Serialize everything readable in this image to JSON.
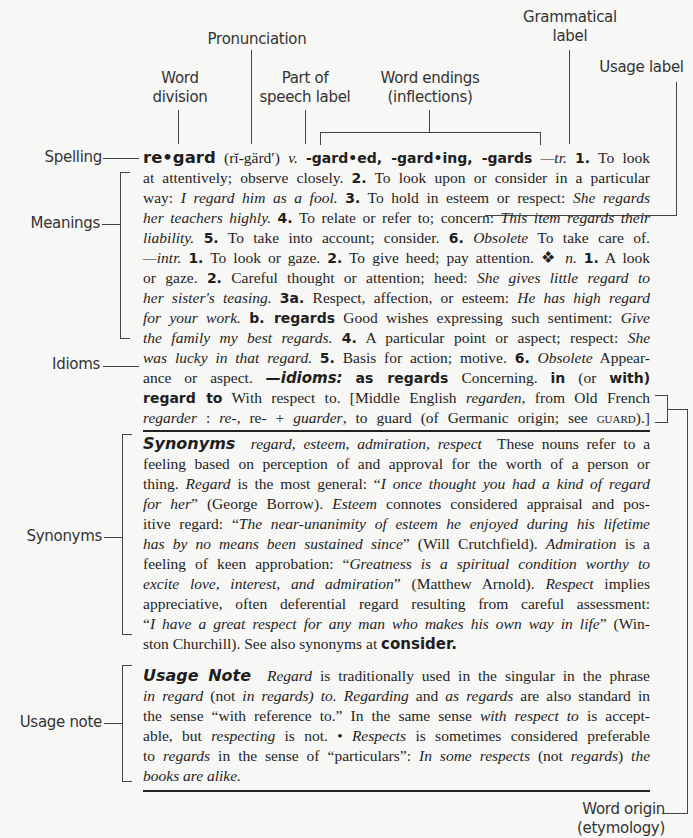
{
  "callouts": {
    "pronunciation": "Pronunciation",
    "grammatical_label": [
      "Grammatical",
      "label"
    ],
    "usage_label": "Usage label",
    "word_division": [
      "Word",
      "division"
    ],
    "part_of_speech": [
      "Part of",
      "speech label"
    ],
    "word_endings": [
      "Word endings",
      "(inflections)"
    ],
    "spelling": "Spelling",
    "meanings": "Meanings",
    "idioms": "Idioms",
    "synonyms": "Synonyms",
    "usage_note": "Usage note",
    "word_origin": [
      "Word origin",
      "(etymology)"
    ]
  },
  "entry": {
    "headword": "re•gard",
    "pronunciation": "(rĭ-gärd′)",
    "pos": "v.",
    "inflections": "-gard•ed, -gard•ing, -gards",
    "tr_label": "—tr.",
    "lines": [
      [
        "at attentively; observe closely. ",
        "2.",
        " To look upon or consider in a particular"
      ],
      [
        "way: ",
        "I regard him as a fool.",
        " ",
        "3.",
        " To hold in esteem or respect: ",
        "She regards"
      ],
      [
        "her teachers highly.",
        " ",
        "4.",
        " To relate or refer to; concern: ",
        "This item regards their"
      ],
      [
        "liability.",
        " ",
        "5.",
        " To take into account; consider. ",
        "6.",
        " ",
        "Obsolete",
        " To take care of."
      ],
      [
        "—intr.",
        " ",
        "1.",
        " To look or gaze. ",
        "2.",
        " To give heed; pay attention. ❖ ",
        "n.",
        " ",
        "1.",
        " A look"
      ],
      [
        "or gaze. ",
        "2.",
        " Careful thought or attention; heed: ",
        "She gives little regard to"
      ],
      [
        "her sister's teasing.",
        " ",
        "3a.",
        " Respect, affection, or esteem: ",
        "He has high regard"
      ],
      [
        "for your work.",
        " ",
        "b. regards",
        " Good wishes expressing such sentiment: ",
        "Give"
      ],
      [
        "the family my best regards.",
        " ",
        "4.",
        " A particular point or aspect; respect: ",
        "She"
      ],
      [
        "was lucky in that regard.",
        " ",
        "5.",
        " Basis for action; motive. ",
        "6.",
        " ",
        "Obsolete",
        " Appear-"
      ],
      [
        "ance or aspect. ",
        "—idioms:",
        " ",
        "as regards",
        " Concerning. ",
        "in",
        " (or ",
        "with)"
      ],
      [
        "regard to",
        " With respect to. [Middle English ",
        "regarden",
        ", from Old French"
      ],
      [
        "regarder",
        " : ",
        "re-",
        ", re- + ",
        "guarder",
        ", to guard (of Germanic origin; see ",
        "guard",
        ").]"
      ]
    ],
    "first_line_tail": [
      "1.",
      " To look"
    ]
  },
  "synonyms": {
    "heading": "Synonyms",
    "words": "regard, esteem, admiration, respect",
    "lines": [
      [
        "These nouns refer to a"
      ],
      [
        "feeling based on perception of and approval for the worth of a person or"
      ],
      [
        "thing. ",
        "Regard",
        " is the most general: “",
        "I once thought you had a kind of regard"
      ],
      [
        "for her",
        "” (George Borrow). ",
        "Esteem",
        " connotes considered appraisal and pos-"
      ],
      [
        "itive regard: “",
        "The near-unanimity of esteem he enjoyed during his lifetime"
      ],
      [
        "has by no means been sustained since",
        "” (Will Crutchfield). ",
        "Admiration",
        " is a"
      ],
      [
        "feeling of keen approbation: “",
        "Greatness is a spiritual condition worthy to"
      ],
      [
        "excite love, interest, and admiration",
        "” (Matthew Arnold). ",
        "Respect",
        " implies"
      ],
      [
        "appreciative, often deferential regard resulting from careful assessment:"
      ],
      [
        "“",
        "I have a great respect for any man who makes his own way in life",
        "” (Win-"
      ],
      [
        "ston Churchill). See also synonyms at ",
        "consider."
      ]
    ]
  },
  "usage_note": {
    "heading": "Usage Note",
    "lines": [
      [
        "Regard",
        " is traditionally used in the singular in the phrase"
      ],
      [
        "in regard",
        " (not ",
        "in regards) to.",
        " ",
        "Regarding",
        " and ",
        "as regards",
        " are also standard in"
      ],
      [
        "the sense “with reference to.” In the same sense ",
        "with respect to",
        " is accept-"
      ],
      [
        "able, but ",
        "respecting",
        " is not. • ",
        "Respects",
        " is sometimes considered preferable"
      ],
      [
        "to ",
        "regards",
        " in the sense of “particulars”: ",
        "In some respects",
        " (not ",
        "regards",
        ") ",
        "the"
      ],
      [
        "books are alike."
      ]
    ]
  }
}
